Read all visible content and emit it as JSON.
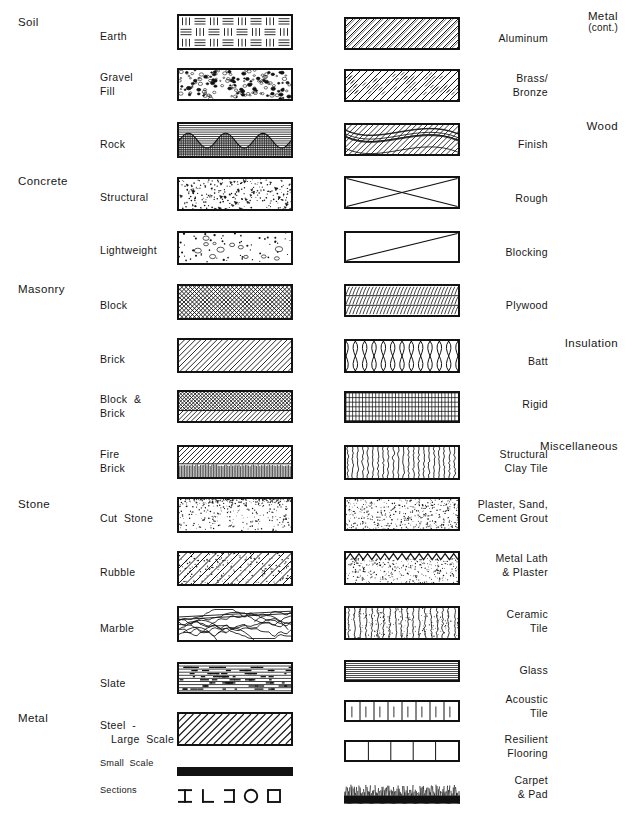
{
  "document": {
    "title": "Architectural Materials Hatching / Graphic Symbols Chart",
    "columns": 2
  },
  "categories": [
    {
      "name": "soil",
      "label": "Soil",
      "column": "left",
      "x": 18,
      "y": 16
    },
    {
      "name": "concrete",
      "label": "Concrete",
      "column": "left",
      "x": 18,
      "y": 175
    },
    {
      "name": "masonry",
      "label": "Masonry",
      "column": "left",
      "x": 18,
      "y": 283
    },
    {
      "name": "stone",
      "label": "Stone",
      "column": "left",
      "x": 18,
      "y": 498
    },
    {
      "name": "metal",
      "label": "Metal",
      "column": "left",
      "x": 18,
      "y": 712
    },
    {
      "name": "metal-cont",
      "label": "Metal",
      "sublabel": "(cont.)",
      "column": "right",
      "x": 618,
      "y": 10
    },
    {
      "name": "wood",
      "label": "Wood",
      "column": "right",
      "x": 618,
      "y": 120
    },
    {
      "name": "insulation",
      "label": "Insulation",
      "column": "right",
      "x": 618,
      "y": 337
    },
    {
      "name": "miscellaneous",
      "label": "Miscellaneous",
      "column": "right",
      "x": 618,
      "y": 440
    }
  ],
  "left_column": {
    "items": [
      {
        "name": "earth",
        "label": "Earth",
        "pattern": "earth",
        "label_x": 100,
        "label_y": 37,
        "sw_x": 177,
        "sw_y": 14,
        "sw_w": 116,
        "sw_h": 36
      },
      {
        "name": "gravel-fill",
        "label": "Gravel\nFill",
        "pattern": "gravel",
        "label_x": 100,
        "label_y": 78,
        "sw_x": 177,
        "sw_y": 68,
        "sw_w": 116,
        "sw_h": 33
      },
      {
        "name": "rock",
        "label": "Rock",
        "pattern": "rock",
        "label_x": 100,
        "label_y": 145,
        "sw_x": 177,
        "sw_y": 122,
        "sw_w": 116,
        "sw_h": 36
      },
      {
        "name": "structural-concrete",
        "label": "Structural",
        "pattern": "concrete-structural",
        "label_x": 100,
        "label_y": 198,
        "sw_x": 177,
        "sw_y": 177,
        "sw_w": 116,
        "sw_h": 34
      },
      {
        "name": "lightweight-concrete",
        "label": "Lightweight",
        "pattern": "concrete-lightweight",
        "label_x": 100,
        "label_y": 251,
        "sw_x": 177,
        "sw_y": 231,
        "sw_w": 116,
        "sw_h": 34
      },
      {
        "name": "block",
        "label": "Block",
        "pattern": "block",
        "label_x": 100,
        "label_y": 306,
        "sw_x": 177,
        "sw_y": 284,
        "sw_w": 116,
        "sw_h": 36
      },
      {
        "name": "brick",
        "label": "Brick",
        "pattern": "brick",
        "label_x": 100,
        "label_y": 360,
        "sw_x": 177,
        "sw_y": 338,
        "sw_w": 116,
        "sw_h": 35
      },
      {
        "name": "block-and-brick",
        "label": "Block  &\nBrick",
        "pattern": "block-brick",
        "label_x": 100,
        "label_y": 400,
        "sw_x": 177,
        "sw_y": 390,
        "sw_w": 116,
        "sw_h": 33
      },
      {
        "name": "fire-brick",
        "label": "Fire\nBrick",
        "pattern": "fire-brick",
        "label_x": 100,
        "label_y": 455,
        "sw_x": 177,
        "sw_y": 445,
        "sw_w": 116,
        "sw_h": 34
      },
      {
        "name": "cut-stone",
        "label": "Cut  Stone",
        "pattern": "cut-stone",
        "label_x": 100,
        "label_y": 519,
        "sw_x": 177,
        "sw_y": 497,
        "sw_w": 116,
        "sw_h": 36
      },
      {
        "name": "rubble",
        "label": "Rubble",
        "pattern": "rubble",
        "label_x": 100,
        "label_y": 573,
        "sw_x": 177,
        "sw_y": 551,
        "sw_w": 116,
        "sw_h": 35
      },
      {
        "name": "marble",
        "label": "Marble",
        "pattern": "marble",
        "label_x": 100,
        "label_y": 629,
        "sw_x": 177,
        "sw_y": 606,
        "sw_w": 116,
        "sw_h": 36
      },
      {
        "name": "slate",
        "label": "Slate",
        "pattern": "slate",
        "label_x": 100,
        "label_y": 684,
        "sw_x": 177,
        "sw_y": 662,
        "sw_w": 116,
        "sw_h": 32
      },
      {
        "name": "steel-large-scale",
        "label": "Steel  -",
        "sublabel": "Large  Scale",
        "pattern": "steel-large",
        "label_x": 100,
        "label_y": 726,
        "sw_x": 177,
        "sw_y": 712,
        "sw_w": 116,
        "sw_h": 34
      },
      {
        "name": "steel-small-scale",
        "label": "Small  Scale",
        "pattern": "steel-small",
        "small": true,
        "label_x": 100,
        "label_y": 764,
        "sw_x": 177,
        "sw_y": 767,
        "sw_w": 116,
        "sw_h": 9
      },
      {
        "name": "steel-sections",
        "label": "Sections",
        "pattern": "steel-sections",
        "small": true,
        "label_x": 100,
        "label_y": 791,
        "sw_x": 177,
        "sw_y": 785,
        "sw_w": 116,
        "sw_h": 22
      }
    ]
  },
  "right_column": {
    "items": [
      {
        "name": "aluminum",
        "label": "Aluminum",
        "pattern": "aluminum",
        "label_x": 548,
        "label_y": 39,
        "sw_x": 344,
        "sw_y": 17,
        "sw_w": 116,
        "sw_h": 33
      },
      {
        "name": "brass-bronze",
        "label": "Brass/\nBronze",
        "pattern": "brass",
        "label_x": 548,
        "label_y": 79,
        "sw_x": 344,
        "sw_y": 69,
        "sw_w": 116,
        "sw_h": 33
      },
      {
        "name": "wood-finish",
        "label": "Finish",
        "pattern": "wood-finish",
        "label_x": 548,
        "label_y": 145,
        "sw_x": 344,
        "sw_y": 123,
        "sw_w": 116,
        "sw_h": 33
      },
      {
        "name": "wood-rough",
        "label": "Rough",
        "pattern": "wood-rough",
        "label_x": 548,
        "label_y": 199,
        "sw_x": 344,
        "sw_y": 176,
        "sw_w": 116,
        "sw_h": 33
      },
      {
        "name": "wood-blocking",
        "label": "Blocking",
        "pattern": "wood-blocking",
        "label_x": 548,
        "label_y": 253,
        "sw_x": 344,
        "sw_y": 231,
        "sw_w": 116,
        "sw_h": 32
      },
      {
        "name": "plywood",
        "label": "Plywood",
        "pattern": "plywood",
        "label_x": 548,
        "label_y": 306,
        "sw_x": 344,
        "sw_y": 284,
        "sw_w": 116,
        "sw_h": 33
      },
      {
        "name": "insulation-batt",
        "label": "Batt",
        "pattern": "batt",
        "label_x": 548,
        "label_y": 362,
        "sw_x": 344,
        "sw_y": 339,
        "sw_w": 116,
        "sw_h": 34
      },
      {
        "name": "insulation-rigid",
        "label": "Rigid",
        "pattern": "rigid",
        "label_x": 548,
        "label_y": 405,
        "sw_x": 344,
        "sw_y": 391,
        "sw_w": 116,
        "sw_h": 32
      },
      {
        "name": "structural-clay-tile",
        "label": "Structural\nClay Tile",
        "pattern": "clay-tile",
        "label_x": 548,
        "label_y": 455,
        "sw_x": 344,
        "sw_y": 445,
        "sw_w": 116,
        "sw_h": 35
      },
      {
        "name": "plaster-sand-cement-grout",
        "label": "Plaster, Sand,\nCement Grout",
        "pattern": "plaster",
        "label_x": 548,
        "label_y": 505,
        "sw_x": 344,
        "sw_y": 497,
        "sw_w": 116,
        "sw_h": 34
      },
      {
        "name": "metal-lath-plaster",
        "label": "Metal Lath\n& Plaster",
        "pattern": "metal-lath",
        "label_x": 548,
        "label_y": 559,
        "sw_x": 344,
        "sw_y": 551,
        "sw_w": 116,
        "sw_h": 34
      },
      {
        "name": "ceramic-tile",
        "label": "Ceramic\nTile",
        "pattern": "ceramic-tile",
        "label_x": 548,
        "label_y": 615,
        "sw_x": 344,
        "sw_y": 606,
        "sw_w": 116,
        "sw_h": 34
      },
      {
        "name": "glass",
        "label": "Glass",
        "pattern": "glass",
        "label_x": 548,
        "label_y": 671,
        "sw_x": 344,
        "sw_y": 660,
        "sw_w": 116,
        "sw_h": 22
      },
      {
        "name": "acoustic-tile",
        "label": "Acoustic\nTile",
        "pattern": "acoustic-tile",
        "label_x": 548,
        "label_y": 700,
        "sw_x": 344,
        "sw_y": 700,
        "sw_w": 116,
        "sw_h": 22
      },
      {
        "name": "resilient-flooring",
        "label": "Resilient\nFlooring",
        "pattern": "resilient",
        "label_x": 548,
        "label_y": 740,
        "sw_x": 344,
        "sw_y": 740,
        "sw_w": 116,
        "sw_h": 22
      },
      {
        "name": "carpet-pad",
        "label": "Carpet\n& Pad",
        "pattern": "carpet",
        "label_x": 548,
        "label_y": 781,
        "sw_x": 344,
        "sw_y": 782,
        "sw_w": 116,
        "sw_h": 22
      }
    ]
  },
  "metal_sections": {
    "shapes": [
      "I-beam",
      "L-angle",
      "channel",
      "pipe-round",
      "tube-square"
    ]
  },
  "colors": {
    "ink": "#121212",
    "text": "#171717",
    "paper": "#ffffff"
  }
}
